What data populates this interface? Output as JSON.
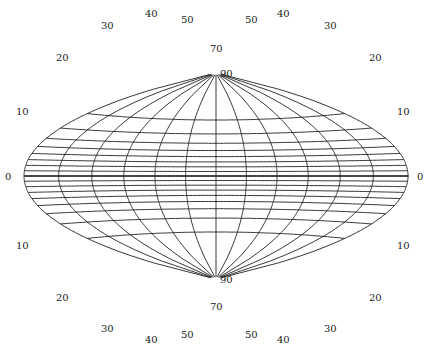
{
  "diagram": {
    "type": "map-projection-graticule",
    "width": 432,
    "height": 353,
    "stroke_color": "#222222",
    "background": "#ffffff",
    "equator_y": 176,
    "center_x": 216,
    "left_edge_x": 25,
    "right_edge_x": 409,
    "north_pole": {
      "x": 216,
      "y": 73,
      "label": "90"
    },
    "south_pole": {
      "x": 216,
      "y": 279,
      "label": "90"
    },
    "equator_meridian_crossings_x": [
      25,
      54,
      86,
      118,
      152,
      184,
      216,
      249,
      282,
      313,
      345,
      378,
      409
    ],
    "latitude_labels": [
      "0",
      "10",
      "20",
      "30",
      "40",
      "50",
      "70",
      "90"
    ],
    "labels": [
      {
        "text": "0",
        "x": 5,
        "y": 180
      },
      {
        "text": "0",
        "x": 417,
        "y": 180
      },
      {
        "text": "10",
        "x": 16,
        "y": 115
      },
      {
        "text": "10",
        "x": 397,
        "y": 115
      },
      {
        "text": "20",
        "x": 56,
        "y": 61
      },
      {
        "text": "20",
        "x": 369,
        "y": 61
      },
      {
        "text": "30",
        "x": 101,
        "y": 29
      },
      {
        "text": "30",
        "x": 324,
        "y": 29
      },
      {
        "text": "40",
        "x": 145,
        "y": 17
      },
      {
        "text": "40",
        "x": 277,
        "y": 17
      },
      {
        "text": "50",
        "x": 181,
        "y": 23
      },
      {
        "text": "50",
        "x": 245,
        "y": 23
      },
      {
        "text": "70",
        "x": 210,
        "y": 52
      },
      {
        "text": "90",
        "x": 220,
        "y": 77
      },
      {
        "text": "10",
        "x": 16,
        "y": 249
      },
      {
        "text": "10",
        "x": 397,
        "y": 249
      },
      {
        "text": "20",
        "x": 56,
        "y": 301
      },
      {
        "text": "20",
        "x": 369,
        "y": 301
      },
      {
        "text": "30",
        "x": 101,
        "y": 332
      },
      {
        "text": "30",
        "x": 324,
        "y": 332
      },
      {
        "text": "40",
        "x": 145,
        "y": 343
      },
      {
        "text": "40",
        "x": 277,
        "y": 343
      },
      {
        "text": "50",
        "x": 181,
        "y": 338
      },
      {
        "text": "50",
        "x": 245,
        "y": 338
      },
      {
        "text": "70",
        "x": 210,
        "y": 310
      },
      {
        "text": "90",
        "x": 220,
        "y": 283
      }
    ]
  }
}
